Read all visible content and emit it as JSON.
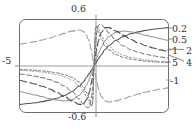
{
  "figure": {
    "title": "",
    "background": "#ffffff",
    "frame_color": "#6e6e6e",
    "axis_color": "#8c8c8c"
  },
  "axis_labels": {
    "top": "0.6",
    "bottom": "-0.6",
    "left": "-5"
  },
  "series_labels": [
    {
      "id": "r0",
      "text": "0.2"
    },
    {
      "id": "r1",
      "text": "0.5"
    },
    {
      "id": "r2",
      "text": "1"
    },
    {
      "id": "r3",
      "text": "2"
    },
    {
      "id": "r4",
      "text": "5"
    },
    {
      "id": "r5",
      "text": "4"
    },
    {
      "id": "r6",
      "text": "-1"
    }
  ],
  "chart_data": {
    "type": "line",
    "title": "",
    "xlabel": "",
    "ylabel": "",
    "xlim": [
      -5,
      5
    ],
    "ylim": [
      -0.6,
      0.6
    ],
    "xticks": [
      -5
    ],
    "xticklabels": [
      "-5"
    ],
    "yticks": [
      -0.6,
      0.6
    ],
    "yticklabels": [
      "-0.6",
      "0.6"
    ],
    "grid": false,
    "legend_position": "right-outside",
    "legend_entries": [
      "0.2",
      "0.5",
      "1",
      "2",
      "4",
      "5",
      "-1"
    ],
    "annotations": [
      "0.6",
      "-0.6",
      "-5",
      "0.2",
      "0.5",
      "1",
      "2",
      "4",
      "5",
      "-1"
    ],
    "x": [
      -5,
      -4.5,
      -4,
      -3.5,
      -3,
      -2.5,
      -2,
      -1.5,
      -1,
      -0.75,
      -0.5,
      -0.4,
      -0.3,
      -0.2,
      -0.15,
      -0.1,
      -0.05,
      0,
      0.05,
      0.1,
      0.15,
      0.2,
      0.3,
      0.4,
      0.5,
      0.75,
      1,
      1.5,
      2,
      2.5,
      3,
      3.5,
      4,
      4.5,
      5
    ],
    "series": [
      {
        "name": "0.2",
        "label": "0.2",
        "style": "solid",
        "color": "#555555",
        "width": 1.1,
        "values": [
          -0.5,
          -0.49,
          -0.48,
          -0.465,
          -0.445,
          -0.42,
          -0.385,
          -0.335,
          -0.265,
          -0.215,
          -0.15,
          -0.122,
          -0.093,
          -0.063,
          -0.047,
          -0.032,
          -0.016,
          0,
          0.016,
          0.032,
          0.047,
          0.063,
          0.093,
          0.122,
          0.15,
          0.215,
          0.265,
          0.335,
          0.385,
          0.42,
          0.445,
          0.465,
          0.48,
          0.49,
          0.5
        ]
      },
      {
        "name": "0.5",
        "label": "0.5",
        "style": "solid",
        "color": "#8a8a8a",
        "width": 1.0,
        "values": [
          -0.335,
          -0.355,
          -0.378,
          -0.4,
          -0.425,
          -0.445,
          -0.455,
          -0.44,
          -0.385,
          -0.33,
          -0.25,
          -0.208,
          -0.162,
          -0.111,
          -0.085,
          -0.057,
          -0.029,
          0,
          0.029,
          0.057,
          0.085,
          0.111,
          0.162,
          0.208,
          0.25,
          0.33,
          0.385,
          0.44,
          0.455,
          0.445,
          0.425,
          0.4,
          0.378,
          0.355,
          0.335
        ]
      },
      {
        "name": "1",
        "label": "1",
        "style": "longdash",
        "color": "#4a4a4a",
        "width": 1.1,
        "values": [
          -0.19,
          -0.21,
          -0.235,
          -0.265,
          -0.3,
          -0.345,
          -0.4,
          -0.455,
          -0.5,
          -0.5,
          -0.44,
          -0.395,
          -0.33,
          -0.24,
          -0.19,
          -0.13,
          -0.066,
          0,
          0.066,
          0.13,
          0.19,
          0.24,
          0.33,
          0.395,
          0.44,
          0.5,
          0.5,
          0.455,
          0.4,
          0.345,
          0.3,
          0.265,
          0.235,
          0.21,
          0.19
        ]
      },
      {
        "name": "2",
        "label": "2",
        "style": "dash",
        "color": "#6a6a6a",
        "width": 1.0,
        "values": [
          -0.105,
          -0.117,
          -0.133,
          -0.152,
          -0.178,
          -0.212,
          -0.26,
          -0.33,
          -0.43,
          -0.49,
          -0.54,
          -0.545,
          -0.53,
          -0.45,
          -0.385,
          -0.28,
          -0.145,
          0,
          0.145,
          0.28,
          0.385,
          0.45,
          0.53,
          0.545,
          0.54,
          0.49,
          0.43,
          0.33,
          0.26,
          0.212,
          0.178,
          0.152,
          0.133,
          0.117,
          0.105
        ]
      },
      {
        "name": "4",
        "label": "4",
        "style": "dot",
        "color": "#909090",
        "width": 1.0,
        "values": [
          -0.055,
          -0.061,
          -0.069,
          -0.079,
          -0.093,
          -0.112,
          -0.139,
          -0.182,
          -0.255,
          -0.315,
          -0.4,
          -0.445,
          -0.49,
          -0.525,
          -0.52,
          -0.47,
          -0.28,
          0,
          0.28,
          0.47,
          0.52,
          0.525,
          0.49,
          0.445,
          0.4,
          0.315,
          0.255,
          0.182,
          0.139,
          0.112,
          0.093,
          0.079,
          0.069,
          0.061,
          0.055
        ]
      },
      {
        "name": "5",
        "label": "5",
        "style": "shortdash",
        "color": "#7a7a7a",
        "width": 1.0,
        "values": [
          -0.044,
          -0.049,
          -0.055,
          -0.063,
          -0.075,
          -0.09,
          -0.112,
          -0.147,
          -0.208,
          -0.262,
          -0.345,
          -0.392,
          -0.445,
          -0.505,
          -0.522,
          -0.5,
          -0.33,
          0,
          0.33,
          0.5,
          0.522,
          0.505,
          0.445,
          0.392,
          0.345,
          0.262,
          0.208,
          0.147,
          0.112,
          0.09,
          0.075,
          0.063,
          0.055,
          0.049,
          0.044
        ]
      },
      {
        "name": "-1",
        "label": "-1",
        "style": "longdash",
        "color": "#a0a0a0",
        "width": 1.1,
        "values": [
          0.285,
          0.3,
          0.318,
          0.34,
          0.365,
          0.395,
          0.425,
          0.455,
          0.47,
          0.455,
          0.4,
          0.355,
          0.3,
          0.22,
          0.172,
          0.118,
          0.06,
          0,
          -0.06,
          -0.118,
          -0.172,
          -0.22,
          -0.3,
          -0.355,
          -0.4,
          -0.455,
          -0.47,
          -0.455,
          -0.425,
          -0.395,
          -0.365,
          -0.34,
          -0.318,
          -0.3,
          -0.285
        ]
      }
    ]
  }
}
